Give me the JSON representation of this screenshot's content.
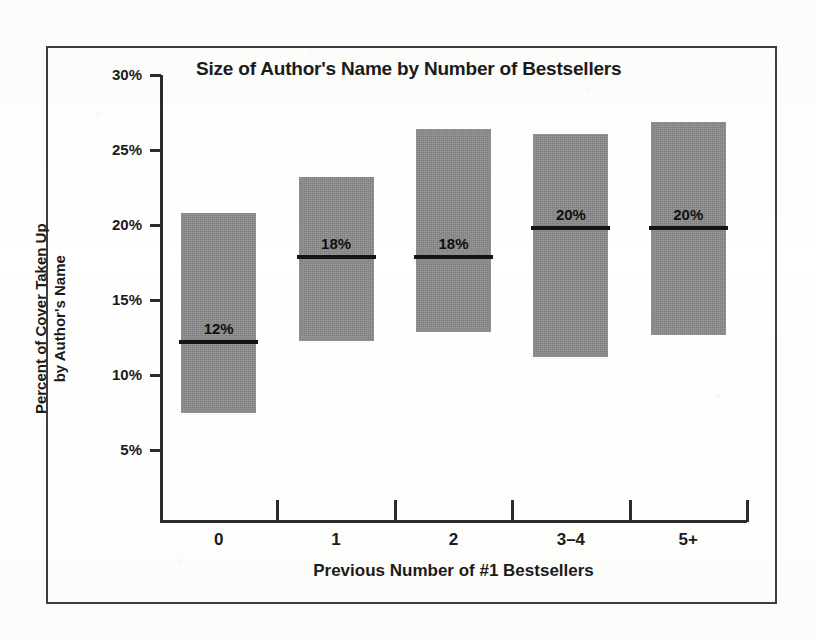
{
  "figure": {
    "frame_color": "#3d3d3d",
    "background": "#fdfdfb"
  },
  "chart_data": {
    "type": "bar",
    "title": "Size of Author's Name by Number of Bestsellers",
    "xlabel": "Previous Number of #1 Bestsellers",
    "ylabel_line1": "Percent of Cover Taken Up",
    "ylabel_line2": "by Author's Name",
    "ylabel": "Percent of Cover Taken Up by Author's Name",
    "categories": [
      "0",
      "1",
      "2",
      "3–4",
      "5+"
    ],
    "ylim": [
      0,
      30
    ],
    "ytick_values": [
      30,
      25,
      20,
      15,
      10,
      5
    ],
    "ytick_labels": [
      "30%",
      "25%",
      "20%",
      "15%",
      "10%",
      "5%"
    ],
    "grid": false,
    "legend": "none",
    "bar_color": "#8c8c8c",
    "median_color": "#141414",
    "series": [
      {
        "name": "Range of cover percentage taken up by author's name",
        "ranges": [
          {
            "category": "0",
            "low": 7.5,
            "high": 20.8,
            "median": 12.2,
            "median_label": "12%"
          },
          {
            "category": "1",
            "low": 12.3,
            "high": 23.2,
            "median": 17.9,
            "median_label": "18%"
          },
          {
            "category": "2",
            "low": 12.9,
            "high": 26.4,
            "median": 17.9,
            "median_label": "18%"
          },
          {
            "category": "3–4",
            "low": 11.2,
            "high": 26.1,
            "median": 19.8,
            "median_label": "20%"
          },
          {
            "category": "5+",
            "low": 12.7,
            "high": 26.9,
            "median": 19.8,
            "median_label": "20%"
          }
        ]
      }
    ],
    "values": [
      12.2,
      17.9,
      17.9,
      19.8,
      19.8
    ],
    "data_labels": [
      "12%",
      "18%",
      "18%",
      "20%",
      "20%"
    ]
  }
}
